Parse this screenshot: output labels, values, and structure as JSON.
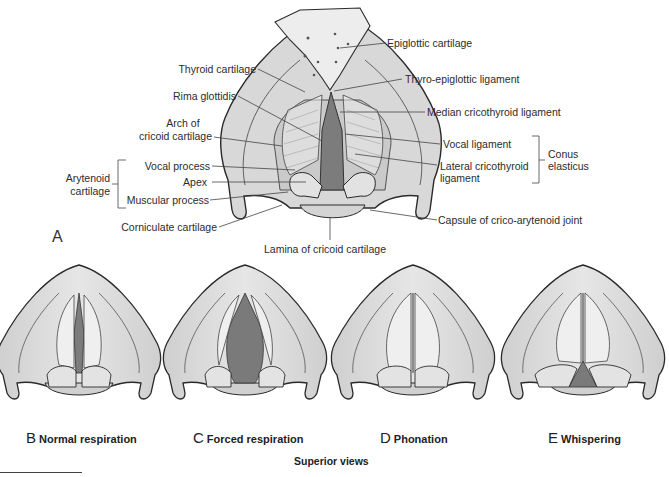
{
  "figure_a": {
    "panel_letter": "A",
    "labels_left": {
      "thyroid_cartilage": "Thyroid cartilage",
      "rima_glottidis": "Rima glottidis",
      "arch_of_cricoid_line1": "Arch of",
      "arch_of_cricoid_line2": "cricoid cartilage",
      "vocal_process": "Vocal process",
      "apex": "Apex",
      "muscular_process": "Muscular process",
      "corniculate_cartilage": "Corniculate cartilage",
      "arytenoid_group_line1": "Arytenoid",
      "arytenoid_group_line2": "cartilage"
    },
    "labels_right": {
      "epiglottic_cartilage": "Epiglottic cartilage",
      "thyro_epiglottic_ligament": "Thyro-epiglottic ligament",
      "median_cricothyroid_ligament": "Median cricothyroid ligament",
      "vocal_ligament": "Vocal ligament",
      "lateral_cricothyroid_line1": "Lateral cricothyroid",
      "lateral_cricothyroid_line2": "ligament",
      "conus_group_line1": "Conus",
      "conus_group_line2": "elasticus",
      "capsule_joint": "Capsule of crico-arytenoid joint"
    },
    "labels_bottom": {
      "lamina_cricoid": "Lamina of cricoid cartilage"
    }
  },
  "views": [
    {
      "letter": "B",
      "caption": "Normal respiration"
    },
    {
      "letter": "C",
      "caption": "Forced respiration"
    },
    {
      "letter": "D",
      "caption": "Phonation"
    },
    {
      "letter": "E",
      "caption": "Whispering"
    }
  ],
  "footer": {
    "caption": "Superior views"
  },
  "colors": {
    "cartilage_fill": "#d9d9d9",
    "cartilage_light": "#ebebeb",
    "outline": "#2a2a2a",
    "glottis_dark": "#7a7a7a",
    "leader_line": "#444444"
  }
}
